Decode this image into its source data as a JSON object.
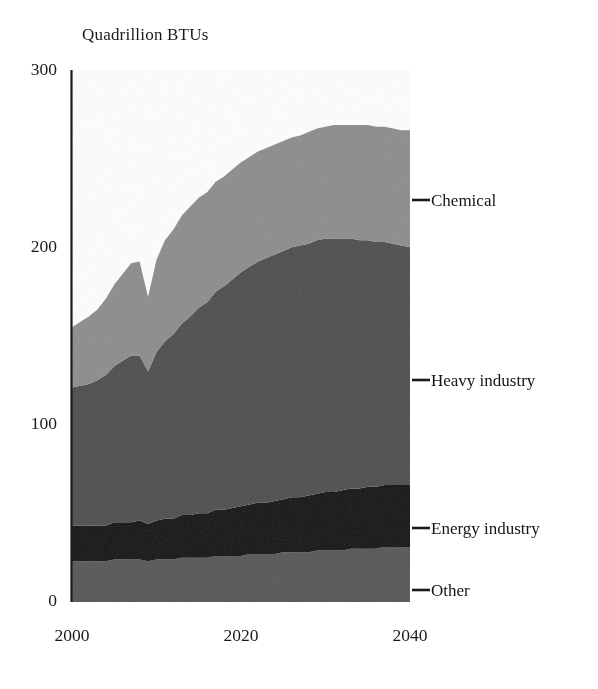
{
  "figure": {
    "axis_title": "Quadrillion BTUs",
    "background_color": "#ffffff",
    "axis_color": "#1b1b1b"
  },
  "legend": {
    "position": "right-direct-labels",
    "items": [
      {
        "label": "Chemical",
        "color": "#8c8c8c",
        "y": 200
      },
      {
        "label": "Heavy industry",
        "color": "#4d4d4d",
        "y": 380
      },
      {
        "label": "Energy industry",
        "color": "#141414",
        "y": 528
      },
      {
        "label": "Other",
        "color": "#565656",
        "y": 590
      }
    ]
  },
  "yaxis": {
    "ticks": [
      "0",
      "100",
      "200",
      "300"
    ],
    "min": 0,
    "max": 300
  },
  "xaxis": {
    "ticks": [
      "2000",
      "2020",
      "2040"
    ],
    "min": 2000,
    "max": 2040
  },
  "chart_data": {
    "type": "area",
    "stacked": true,
    "title": "",
    "subtitle": "",
    "xlabel": "",
    "ylabel": "Quadrillion BTUs",
    "xlim": [
      2000,
      2040
    ],
    "ylim": [
      0,
      300
    ],
    "grid": false,
    "legend_position": "right",
    "x": [
      2000,
      2001,
      2002,
      2003,
      2004,
      2005,
      2006,
      2007,
      2008,
      2009,
      2010,
      2011,
      2012,
      2013,
      2014,
      2015,
      2016,
      2017,
      2018,
      2019,
      2020,
      2021,
      2022,
      2023,
      2024,
      2025,
      2026,
      2027,
      2028,
      2029,
      2030,
      2031,
      2032,
      2033,
      2034,
      2035,
      2036,
      2037,
      2038,
      2039,
      2040
    ],
    "series": [
      {
        "name": "Other",
        "color": "#565656",
        "values": [
          23,
          23,
          23,
          23,
          23,
          24,
          24,
          24,
          24,
          23,
          24,
          24,
          24,
          25,
          25,
          25,
          25,
          26,
          26,
          26,
          26,
          27,
          27,
          27,
          27,
          28,
          28,
          28,
          28,
          29,
          29,
          29,
          29,
          30,
          30,
          30,
          30,
          31,
          31,
          31,
          31
        ]
      },
      {
        "name": "Energy industry",
        "color": "#141414",
        "values": [
          20,
          20,
          20,
          20,
          20,
          21,
          21,
          21,
          22,
          21,
          22,
          23,
          23,
          24,
          24,
          25,
          25,
          26,
          26,
          27,
          28,
          28,
          29,
          29,
          30,
          30,
          31,
          31,
          32,
          32,
          33,
          33,
          34,
          34,
          34,
          35,
          35,
          35,
          35,
          35,
          35
        ]
      },
      {
        "name": "Heavy industry",
        "color": "#4d4d4d",
        "values": [
          78,
          79,
          80,
          82,
          85,
          88,
          91,
          94,
          93,
          86,
          95,
          100,
          104,
          108,
          112,
          116,
          119,
          123,
          126,
          129,
          132,
          134,
          136,
          138,
          139,
          140,
          141,
          142,
          142,
          143,
          143,
          143,
          142,
          141,
          140,
          139,
          138,
          137,
          136,
          135,
          134
        ]
      },
      {
        "name": "Chemical",
        "color": "#8c8c8c",
        "values": [
          34,
          36,
          38,
          40,
          43,
          46,
          49,
          52,
          53,
          42,
          52,
          57,
          59,
          61,
          62,
          62,
          62,
          62,
          62,
          62,
          62,
          62,
          62,
          62,
          62,
          62,
          62,
          62,
          63,
          63,
          63,
          64,
          64,
          64,
          65,
          65,
          65,
          65,
          65,
          65,
          66
        ]
      }
    ],
    "totals_note": {
      "2000": 155,
      "2009": 172,
      "2032": 266,
      "2040": 266
    }
  }
}
